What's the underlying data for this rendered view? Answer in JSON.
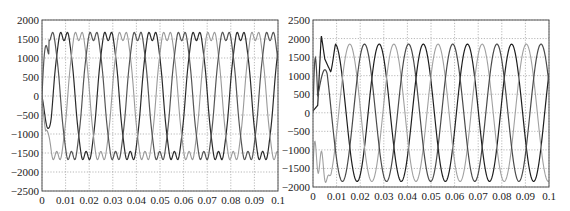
{
  "chart_data": [
    {
      "type": "line",
      "title": "",
      "xlabel": "",
      "ylabel": "",
      "xlim": [
        0,
        0.1
      ],
      "ylim": [
        -2500,
        2000
      ],
      "grid": true,
      "legend": null,
      "x_ticks": [
        "0",
        "0.01",
        "0.02",
        "0.03",
        "0.04",
        "0.05",
        "0.06",
        "0.07",
        "0.08",
        "0.09",
        "0.1"
      ],
      "y_ticks": [
        "2000",
        "1500",
        "1000",
        "500",
        "0",
        "-500",
        "-1000",
        "-1500",
        "-2000",
        "-2500"
      ],
      "series": [
        {
          "name": "phase A",
          "color": "#2a2a2a",
          "amplitude": 1800,
          "phase_deg": 0,
          "period_s": 0.0187,
          "note": "distorted/flat-topped sinusoid"
        },
        {
          "name": "phase B",
          "color": "#999999",
          "amplitude": 1800,
          "phase_deg": -120,
          "period_s": 0.0187,
          "note": "distorted/flat-topped sinusoid"
        },
        {
          "name": "phase C",
          "color": "#555555",
          "amplitude": 1800,
          "phase_deg": 120,
          "period_s": 0.0187,
          "note": "distorted/flat-topped sinusoid"
        }
      ],
      "initial_transient": "startup near 0 with ~1100 bump on one phase and ~-1700 dip on another before t=0.004"
    },
    {
      "type": "line",
      "title": "",
      "xlabel": "",
      "ylabel": "",
      "xlim": [
        0,
        0.1
      ],
      "ylim": [
        -2000,
        2500
      ],
      "grid": true,
      "legend": null,
      "x_ticks": [
        "0",
        "0.01",
        "0.02",
        "0.03",
        "0.04",
        "0.05",
        "0.06",
        "0.07",
        "0.08",
        "0.09",
        "0.1"
      ],
      "y_ticks": [
        "2500",
        "2000",
        "1500",
        "1000",
        "500",
        "0",
        "-500",
        "-1000",
        "-1500",
        "-2000"
      ],
      "series": [
        {
          "name": "phase A",
          "color": "#1e1e1e",
          "amplitude": 1850,
          "phase_deg": 0,
          "period_s": 0.0187,
          "note": "clean sinusoid after transient"
        },
        {
          "name": "phase B",
          "color": "#a0a0a0",
          "amplitude": 1850,
          "phase_deg": -120,
          "period_s": 0.0187,
          "note": "clean sinusoid after transient"
        },
        {
          "name": "phase C",
          "color": "#4a4a4a",
          "amplitude": 1850,
          "phase_deg": 120,
          "period_s": 0.0187,
          "note": "clean sinusoid after transient"
        }
      ],
      "initial_transient": "overshoot to ~2100 at t≈0.003, plateau ~1400 then settling by t≈0.008; other phases dip to ~-1600"
    }
  ]
}
